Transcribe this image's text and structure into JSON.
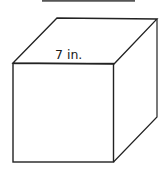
{
  "diagram": {
    "shape": "cube",
    "edge_label": "7 in.",
    "stroke_color": "#222222",
    "top_bar_color": "#555555",
    "vertices": {
      "front_top_left": [
        13,
        63
      ],
      "front_top_right": [
        114,
        64
      ],
      "front_bottom_left": [
        13,
        162
      ],
      "front_bottom_right": [
        113,
        162
      ],
      "back_top_left": [
        57,
        18
      ],
      "back_top_right": [
        157,
        19
      ],
      "back_bottom_right": [
        157,
        117
      ]
    }
  }
}
